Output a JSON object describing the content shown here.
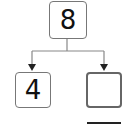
{
  "diagram": {
    "type": "number-bond",
    "whole": {
      "value": "8"
    },
    "parts": [
      {
        "value": "4"
      },
      {
        "value": ""
      }
    ],
    "answer_line": true
  }
}
